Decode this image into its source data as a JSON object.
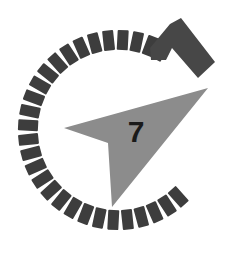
{
  "image": {
    "title": "Stopwatch dial with arrow and numeral",
    "width": 236,
    "height": 267,
    "background_color": "#ffffff"
  },
  "dial": {
    "name": "tick-ring",
    "center_x": 118,
    "center_y": 130,
    "outer_radius": 100,
    "tick_length": 20,
    "tick_width": 11,
    "tick_color": "#3d3d3d",
    "tick_count": 40,
    "gap_description": "no ticks on the right side between roughly 1:30 and 4:30 o'clock",
    "gap_start_deg": -62,
    "gap_end_deg": 48,
    "tick_angles_deg": [
      48,
      57,
      66,
      75,
      84,
      93,
      102,
      111,
      120,
      129,
      138,
      147,
      156,
      165,
      174,
      183,
      192,
      201,
      210,
      219,
      228,
      237,
      246,
      255,
      264,
      273,
      282,
      291,
      298
    ]
  },
  "arrow": {
    "name": "gray-arrow",
    "color": "#8c8c8c",
    "points": "64,128 208,88 112,207 108,143",
    "description": "large gray dart/arrowhead pointing down-right with concave notch"
  },
  "chevron": {
    "name": "dark-chevron",
    "color": "#474747",
    "points": "181,18 215,62 198,78 172,48 166,60 151,60 150,48 170,24",
    "description": "bent angular chevron marker in upper right"
  },
  "numeral": {
    "name": "dial-numeral",
    "value": "7",
    "x": 136,
    "y": 142,
    "color": "#1a1a1a"
  }
}
